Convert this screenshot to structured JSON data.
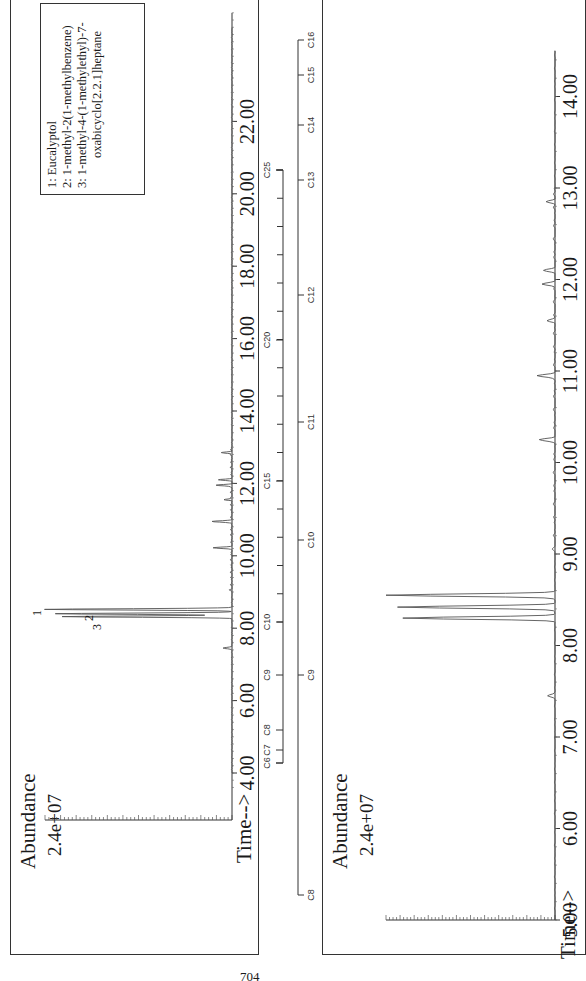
{
  "page_number": "704",
  "chart_data": [
    {
      "type": "line",
      "title": "Total ion chromatogram (full run)",
      "xlabel": "Time-->",
      "ylabel": "Abundance",
      "y_max_label": "2.4e+07",
      "xlim": [
        3.5,
        25
      ],
      "ylim": [
        0,
        24000000
      ],
      "x_ticks": [
        "4.00",
        "6.00",
        "8.00",
        "10.00",
        "12.00",
        "14.00",
        "16.00",
        "18.00",
        "20.00",
        "22.00"
      ],
      "peaks": [
        {
          "label": "1",
          "time": 8.52,
          "abundance": 24000000
        },
        {
          "label": "2",
          "time": 8.4,
          "abundance": 22700000
        },
        {
          "label": "3",
          "time": 8.32,
          "abundance": 21800000
        },
        {
          "time": 7.45,
          "abundance": 1200000
        },
        {
          "time": 9.05,
          "abundance": 150000
        },
        {
          "time": 10.22,
          "abundance": 2300000
        },
        {
          "time": 10.95,
          "abundance": 2600000
        },
        {
          "time": 11.55,
          "abundance": 900000
        },
        {
          "time": 11.95,
          "abundance": 1900000
        },
        {
          "time": 12.1,
          "abundance": 1500000
        },
        {
          "time": 12.85,
          "abundance": 1400000
        }
      ],
      "legend": {
        "entries": [
          "1:  Eucalyptol",
          "2:  1-methyl-2(1-methylbenzene)",
          "3:  1-methyl-4-(1-methylethyl)-7-",
          "oxabicyclo[2.2.1]heptane"
        ]
      }
    },
    {
      "type": "line",
      "title": "Total ion chromatogram (expanded 5–14.5 min)",
      "xlabel": "Time-->",
      "ylabel": "Abundance",
      "y_max_label": "2.4e+07",
      "xlim": [
        5.0,
        14.5
      ],
      "ylim": [
        0,
        24000000
      ],
      "x_ticks": [
        "5.00",
        "6.00",
        "7.00",
        "8.00",
        "9.00",
        "10.00",
        "11.00",
        "12.00",
        "13.00",
        "14.00"
      ],
      "peaks": [
        {
          "time": 8.55,
          "abundance": 24000000
        },
        {
          "time": 8.42,
          "abundance": 22400000
        },
        {
          "time": 8.3,
          "abundance": 21600000
        },
        {
          "time": 7.45,
          "abundance": 1100000
        },
        {
          "time": 9.05,
          "abundance": 200000
        },
        {
          "time": 10.25,
          "abundance": 2100000
        },
        {
          "time": 10.95,
          "abundance": 2600000
        },
        {
          "time": 11.55,
          "abundance": 1000000
        },
        {
          "time": 11.95,
          "abundance": 1700000
        },
        {
          "time": 12.1,
          "abundance": 1400000
        },
        {
          "time": 12.85,
          "abundance": 1300000
        }
      ]
    }
  ],
  "carbon_scales": [
    {
      "labels": [
        "C6",
        "C7",
        "C8",
        "C9",
        "C10",
        "C15",
        "C20",
        "C25"
      ]
    },
    {
      "labels": [
        "C8",
        "C9",
        "C10",
        "C11",
        "C12",
        "C13",
        "C14",
        "C15",
        "C16"
      ]
    }
  ],
  "legend_lines": [
    "1:  Eucalyptol",
    "2:  1-methyl-2(1-methylbenzene)",
    "3:  1-methyl-4-(1-methylethyl)-7-",
    "oxabicyclo[2.2.1]heptane"
  ],
  "charts": {
    "top": {
      "abundance_label": "Abundance",
      "ymax_label": "2.4e+07",
      "time_label": "Time-->"
    },
    "bottom": {
      "abundance_label": "Abundance",
      "ymax_label": "2.4e+07",
      "time_label": "Time-->"
    }
  },
  "peak_labels": [
    "1",
    "2",
    "3"
  ]
}
